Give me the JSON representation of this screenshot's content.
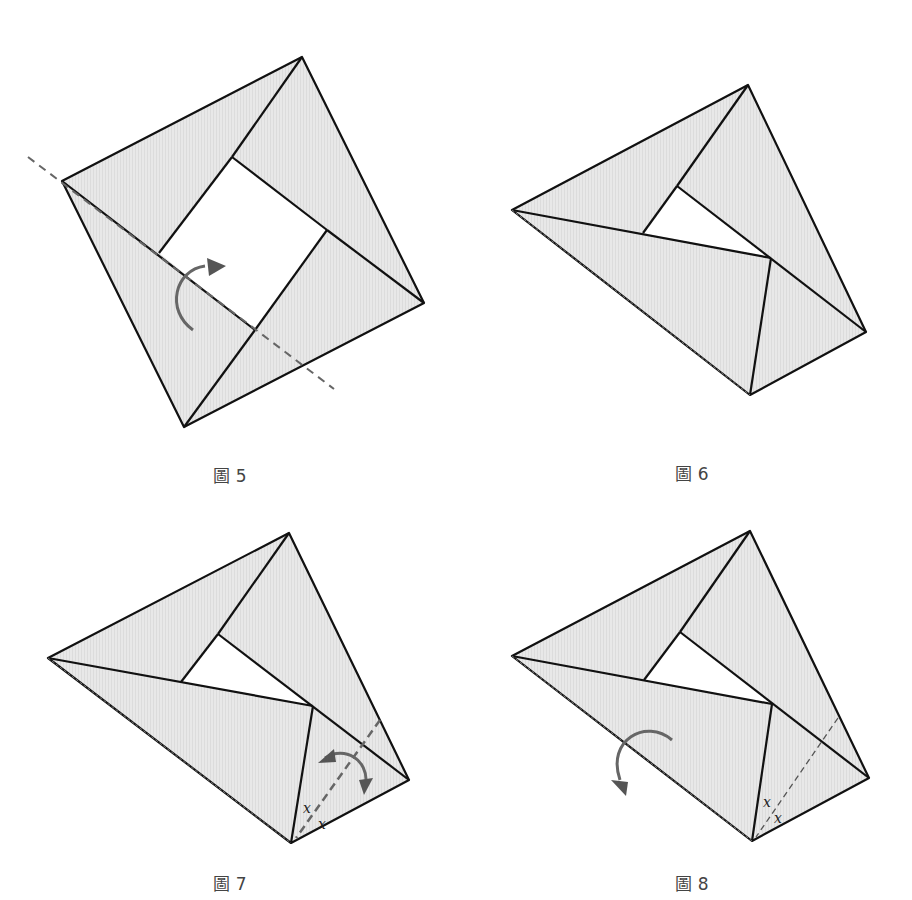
{
  "figures": [
    {
      "id": "fig5",
      "caption": "圖 5"
    },
    {
      "id": "fig6",
      "caption": "圖 6"
    },
    {
      "id": "fig7",
      "caption": "圖 7",
      "angle_labels": [
        "x",
        "x"
      ]
    },
    {
      "id": "fig8",
      "caption": "圖 8",
      "angle_labels": [
        "x",
        "x"
      ]
    }
  ],
  "colors": {
    "paper_fill": "#e6e6e6",
    "outline": "#111111",
    "fold_line": "#6a6a6a",
    "arrow": "#6a6a6a"
  }
}
